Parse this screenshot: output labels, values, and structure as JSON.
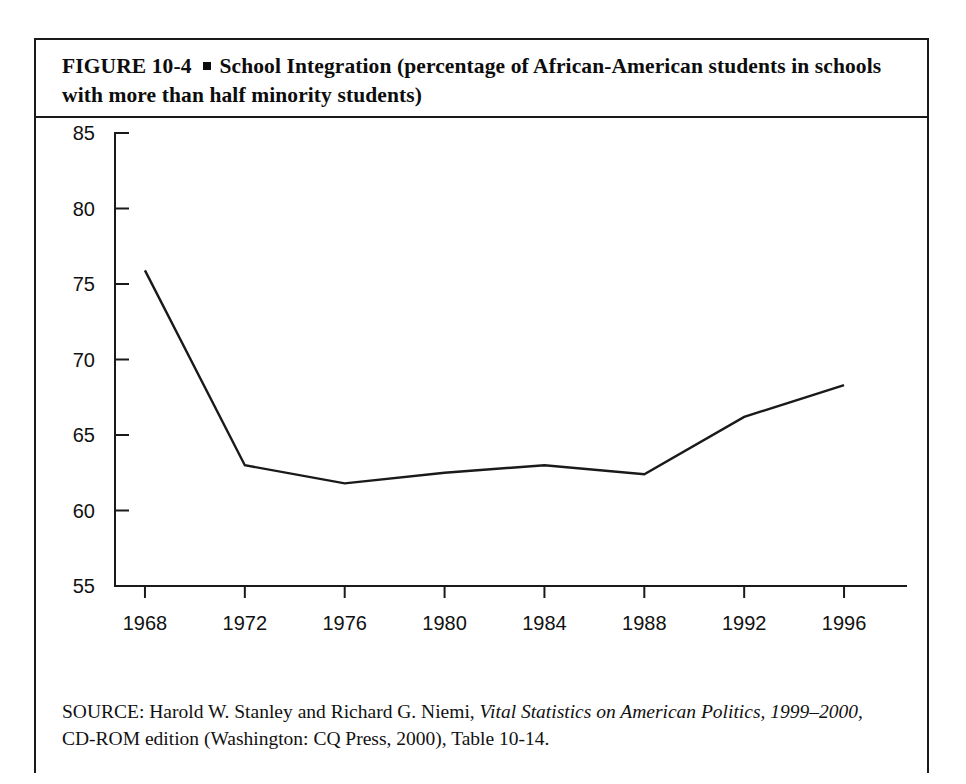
{
  "figure": {
    "label": "FIGURE  10-4",
    "bullet": "square-bullet",
    "title": "School Integration (percentage of African-American students in schools with more than half minority students)",
    "title_line1": "School Integration (percentage of African-American",
    "title_line2": "students in schools with more than half minority students)"
  },
  "source": {
    "prefix": "SOURCE: Harold W. Stanley and Richard G. Niemi,",
    "work_title": "Vital Statistics on American Politics,",
    "work_years": "1999–2000,",
    "suffix": "CD-ROM edition (Washington: CQ Press, 2000), Table 10-14."
  },
  "chart_data": {
    "type": "line",
    "title": "School Integration (percentage of African-American students in schools with more than half minority students)",
    "xlabel": "",
    "ylabel": "",
    "x": [
      1968,
      1972,
      1976,
      1980,
      1984,
      1988,
      1992,
      1996
    ],
    "xtick_labels": [
      "1968",
      "1972",
      "1976",
      "1980",
      "1984",
      "1988",
      "1992",
      "1996"
    ],
    "ytick_labels": [
      "55",
      "60",
      "65",
      "70",
      "75",
      "80",
      "85"
    ],
    "yticks": [
      55,
      60,
      65,
      70,
      75,
      80,
      85
    ],
    "xlim": [
      1966.8,
      1997.4
    ],
    "ylim": [
      55,
      85
    ],
    "grid": false,
    "legend": false,
    "series": [
      {
        "name": "African-American students in majority-minority schools",
        "color": "#1a1a1a",
        "values": [
          75.9,
          63.0,
          61.8,
          62.5,
          63.0,
          62.4,
          66.2,
          68.3
        ]
      }
    ]
  }
}
